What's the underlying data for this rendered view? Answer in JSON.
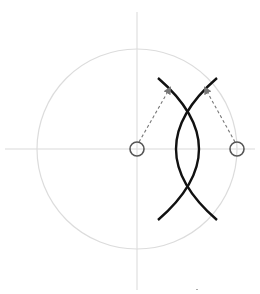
{
  "diagram": {
    "width": 260,
    "height": 294,
    "colors": {
      "background": "#ffffff",
      "axis": "#d9d9d9",
      "outer_circle": "#dcdcdc",
      "node_stroke": "#555555",
      "arc_stroke": "#111111",
      "arrow": "#777777"
    },
    "axes": {
      "horizontal": {
        "x1": 5,
        "y1": 149,
        "x2": 255,
        "y2": 149
      },
      "vertical": {
        "x1": 137,
        "y1": 12,
        "x2": 137,
        "y2": 290
      }
    },
    "outer_circle": {
      "cx": 137,
      "cy": 149,
      "r": 100
    },
    "nodes": [
      {
        "id": "origin-node",
        "cx": 137,
        "cy": 149,
        "r": 7
      },
      {
        "id": "right-node",
        "cx": 237,
        "cy": 149,
        "r": 7
      }
    ],
    "arcs": [
      {
        "id": "arc-right-bulge",
        "d": "M 158 78 Q 240 149 158 220"
      },
      {
        "id": "arc-left-bulge",
        "d": "M 217 78 Q 135 149 217 220"
      }
    ],
    "arrows": [
      {
        "id": "arrow-from-origin",
        "x1": 139,
        "y1": 142,
        "x2": 170,
        "y2": 88
      },
      {
        "id": "arrow-from-right",
        "x1": 235,
        "y1": 142,
        "x2": 205,
        "y2": 88
      }
    ],
    "marks": [
      {
        "id": "tick-mark",
        "x": 196,
        "y": 289
      }
    ]
  }
}
